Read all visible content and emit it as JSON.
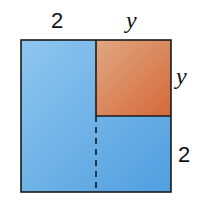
{
  "labels": {
    "top_left": "2",
    "top_right": "y",
    "right_top": "y",
    "right_bottom": "2"
  },
  "colors": {
    "blue": "#5aa8e4",
    "blue_light": "#8fc6ee",
    "orange": "#d9764a",
    "orange_light": "#e0a07a",
    "stroke": "#1a1a1a"
  }
}
